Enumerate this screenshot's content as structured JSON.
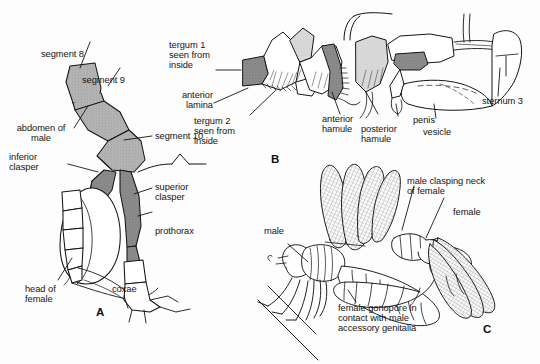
{
  "figure": {
    "background_color": "#fdfdfd",
    "ink_color": "#141414",
    "fills": {
      "light_gray": "#ffffff",
      "mid_gray": "#a9a9a9",
      "dark_gray": "#7d7d7d",
      "pale_gray": "#d3d3d3"
    }
  },
  "panels": [
    {
      "letter": "A",
      "name": "panel-a-tandem-pair",
      "caption": "Male abdomen terminalia clasping head of female"
    },
    {
      "letter": "B",
      "name": "panel-b-accessory-genitalia",
      "caption": "Male accessory genitalia, lateral view"
    },
    {
      "letter": "C",
      "name": "panel-c-mating-wheel",
      "caption": "Mating pair in copulatory position"
    }
  ],
  "labels_a": [
    {
      "id": "segment-8",
      "text": "segment 8"
    },
    {
      "id": "segment-9",
      "text": "segment 9"
    },
    {
      "id": "segment-10",
      "text": "segment 10"
    },
    {
      "id": "abdomen-of-male",
      "text": "abdomen of\nmale"
    },
    {
      "id": "inferior-clasper",
      "text": "inferior\nclasper"
    },
    {
      "id": "superior-clasper",
      "text": "superior\nclasper"
    },
    {
      "id": "prothorax",
      "text": "prothorax"
    },
    {
      "id": "head-of-female",
      "text": "head of\nfemale"
    },
    {
      "id": "coxae",
      "text": "coxae"
    }
  ],
  "labels_b": [
    {
      "id": "tergum-1-seen-from-inside",
      "text": "tergum 1\nseen from\ninside"
    },
    {
      "id": "anterior-lamina",
      "text": "anterior\nlamina"
    },
    {
      "id": "tergum-2-seen-from-inside",
      "text": "tergum 2\nseen from\ninside"
    },
    {
      "id": "anterior-hamule",
      "text": "anterior\nhamule"
    },
    {
      "id": "posterior-hamule",
      "text": "posterior\nhamule"
    },
    {
      "id": "penis",
      "text": "penis"
    },
    {
      "id": "vesicle",
      "text": "vesicle"
    },
    {
      "id": "sternum-3",
      "text": "sternum 3"
    }
  ],
  "labels_c": [
    {
      "id": "male",
      "text": "male"
    },
    {
      "id": "female",
      "text": "female"
    },
    {
      "id": "male-clasping-neck-of-female",
      "text": "male clasping neck\nof female"
    },
    {
      "id": "female-gonopore-contact",
      "text": "female gonopore in\ncontact with male\naccessory genitalia"
    }
  ]
}
